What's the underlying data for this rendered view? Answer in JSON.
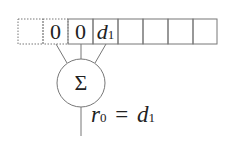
{
  "cells": [
    {
      "value": "",
      "style": "dotted"
    },
    {
      "value": "0",
      "style": "dotted"
    },
    {
      "value": "0",
      "style": "solid"
    },
    {
      "value": "d",
      "sub": "1",
      "style": "solid"
    },
    {
      "value": "",
      "style": "solid"
    },
    {
      "value": "",
      "style": "solid"
    },
    {
      "value": "",
      "style": "solid"
    },
    {
      "value": "",
      "style": "solid"
    }
  ],
  "sum_node": {
    "symbol": "Σ"
  },
  "output": {
    "lhs": "r",
    "lhs_sub": "0",
    "eq": "=",
    "rhs": "d",
    "rhs_sub": "1"
  }
}
